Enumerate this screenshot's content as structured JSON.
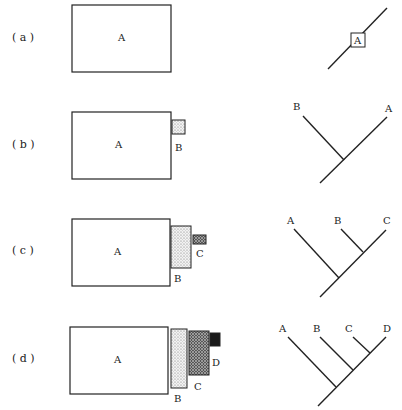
{
  "rows": [
    {
      "label": "( a )",
      "boxes": {
        "A": "A"
      },
      "tree": {
        "A": "A"
      }
    },
    {
      "label": "( b )",
      "boxes": {
        "A": "A",
        "B": "B"
      },
      "tree": {
        "A": "A",
        "B": "B"
      }
    },
    {
      "label": "( c )",
      "boxes": {
        "A": "A",
        "B": "B",
        "C": "C"
      },
      "tree": {
        "A": "A",
        "B": "B",
        "C": "C"
      }
    },
    {
      "label": "( d )",
      "boxes": {
        "A": "A",
        "B": "B",
        "C": "C",
        "D": "D"
      },
      "tree": {
        "A": "A",
        "B": "B",
        "C": "C",
        "D": "D"
      }
    }
  ],
  "colors": {
    "stroke": "#222222",
    "fill_b": "#d9d9d9",
    "fill_c": "#8a8a8a",
    "fill_d": "#1a1a1a"
  }
}
